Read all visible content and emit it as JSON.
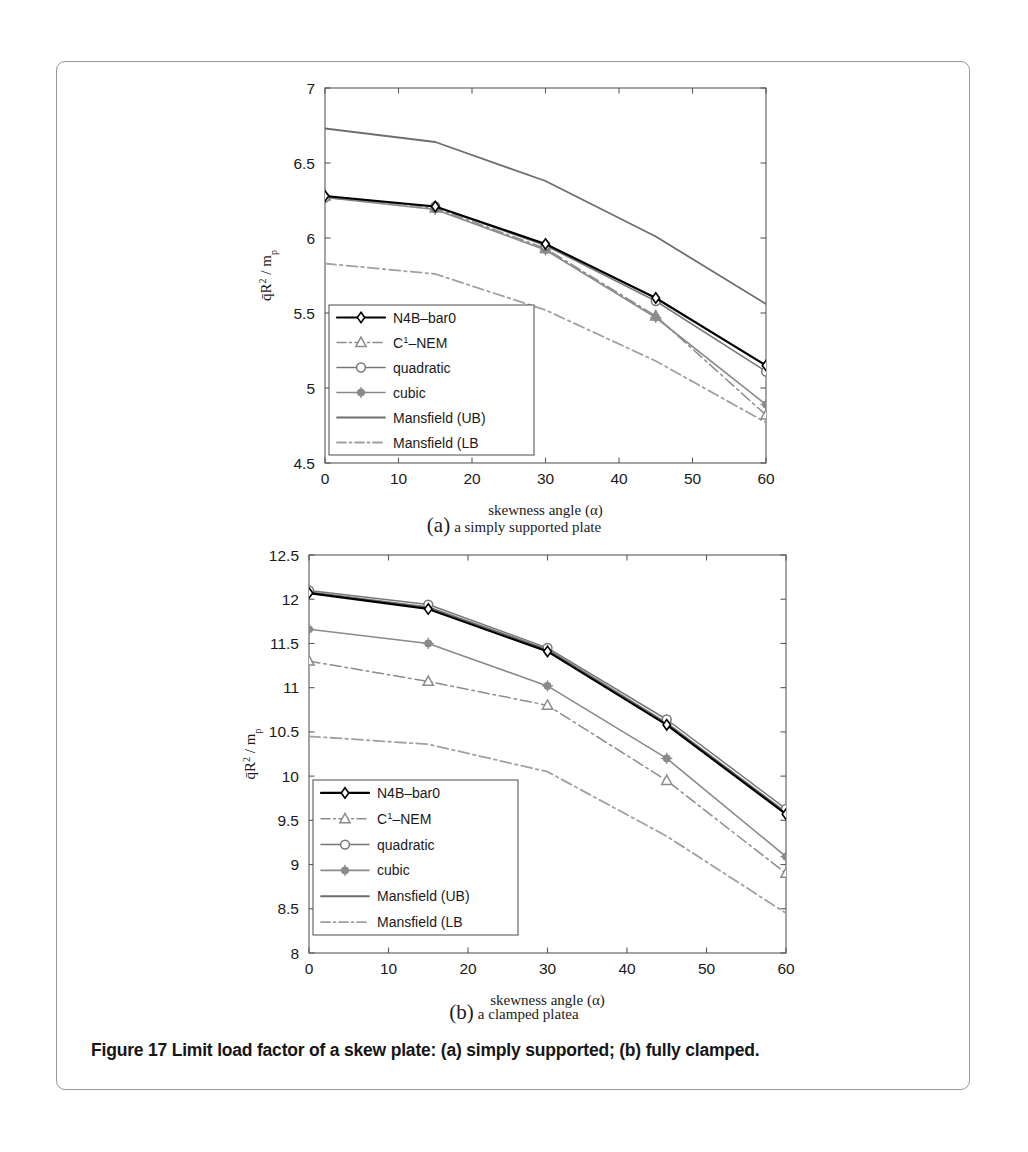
{
  "figure": {
    "caption": "Figure 17 Limit load factor of a skew plate: (a) simply supported; (b) fully clamped.",
    "subcaption_a_paren": "(a)",
    "subcaption_a_text": "a simply supported plate",
    "subcaption_b_paren": "(b)",
    "subcaption_b_text": "a clamped platea"
  },
  "legend_entries": [
    {
      "label": "N4B–bar0",
      "style": "solid",
      "marker": "diamond",
      "color": "#000000",
      "width": 2.2
    },
    {
      "label": "C¹–NEM",
      "style": "dashdot",
      "marker": "triangle",
      "color": "#8c8c8c",
      "width": 1.5
    },
    {
      "label": "quadratic",
      "style": "solid",
      "marker": "circle",
      "color": "#777777",
      "width": 1.5
    },
    {
      "label": "cubic",
      "style": "solid",
      "marker": "star",
      "color": "#8a8a8a",
      "width": 1.6
    },
    {
      "label": "Mansfield (UB)",
      "style": "solid",
      "marker": "none",
      "color": "#6e6e6e",
      "width": 1.8
    },
    {
      "label": "Mansfield (LB",
      "style": "dashdot",
      "marker": "none",
      "color": "#a0a0a0",
      "width": 1.8
    }
  ],
  "chart_data": [
    {
      "id": "chart-a",
      "type": "line",
      "title": "",
      "xlabel": "skewness angle (α)",
      "ylabel": "q̄R² / mₚ",
      "x": [
        0,
        15,
        30,
        45,
        60
      ],
      "xlim": [
        0,
        60
      ],
      "ylim": [
        4.5,
        7
      ],
      "xticks": [
        0,
        10,
        20,
        30,
        40,
        50,
        60
      ],
      "yticks": [
        4.5,
        5,
        5.5,
        6,
        6.5,
        7
      ],
      "xticklabels": [
        "0",
        "10",
        "20",
        "30",
        "40",
        "50",
        "60"
      ],
      "yticklabels": [
        "4.5",
        "5",
        "5.5",
        "6",
        "6.5",
        "7"
      ],
      "grid": false,
      "legend_position": "lower-left",
      "series": [
        {
          "name": "N4B–bar0",
          "values": [
            6.28,
            6.21,
            5.96,
            5.6,
            5.15
          ]
        },
        {
          "name": "C¹–NEM",
          "values": [
            6.28,
            6.2,
            5.93,
            5.48,
            4.82
          ]
        },
        {
          "name": "quadratic",
          "values": [
            6.27,
            6.21,
            5.95,
            5.58,
            5.11
          ]
        },
        {
          "name": "cubic",
          "values": [
            6.27,
            6.19,
            5.92,
            5.47,
            4.89
          ]
        },
        {
          "name": "Mansfield (UB)",
          "values": [
            6.73,
            6.64,
            6.38,
            6.01,
            5.56
          ]
        },
        {
          "name": "Mansfield (LB",
          "values": [
            5.83,
            5.76,
            5.52,
            5.18,
            4.77
          ]
        }
      ]
    },
    {
      "id": "chart-b",
      "type": "line",
      "title": "",
      "xlabel": "skewness angle (α)",
      "ylabel": "q̄R² / mₚ",
      "x": [
        0,
        15,
        30,
        45,
        60
      ],
      "xlim": [
        0,
        60
      ],
      "ylim": [
        8,
        12.5
      ],
      "xticks": [
        0,
        10,
        20,
        30,
        40,
        50,
        60
      ],
      "yticks": [
        8,
        8.5,
        9,
        9.5,
        10,
        10.5,
        11,
        11.5,
        12,
        12.5
      ],
      "xticklabels": [
        "0",
        "10",
        "20",
        "30",
        "40",
        "50",
        "60"
      ],
      "yticklabels": [
        "8",
        "8.5",
        "9",
        "9.5",
        "10",
        "10.5",
        "11",
        "11.5",
        "12",
        "12.5"
      ],
      "grid": false,
      "legend_position": "lower-left",
      "series": [
        {
          "name": "N4B–bar0",
          "values": [
            12.07,
            11.89,
            11.41,
            10.58,
            9.57
          ]
        },
        {
          "name": "C¹–NEM",
          "values": [
            11.3,
            11.07,
            10.8,
            9.95,
            8.9
          ]
        },
        {
          "name": "quadratic",
          "values": [
            12.1,
            11.94,
            11.45,
            10.64,
            9.63
          ]
        },
        {
          "name": "cubic",
          "values": [
            11.66,
            11.5,
            11.02,
            10.2,
            9.09
          ]
        },
        {
          "name": "Mansfield (UB)",
          "values": [
            12.08,
            11.91,
            11.43,
            10.6,
            9.59
          ]
        },
        {
          "name": "Mansfield (LB",
          "values": [
            10.45,
            10.36,
            10.05,
            9.32,
            8.45
          ]
        }
      ]
    }
  ]
}
